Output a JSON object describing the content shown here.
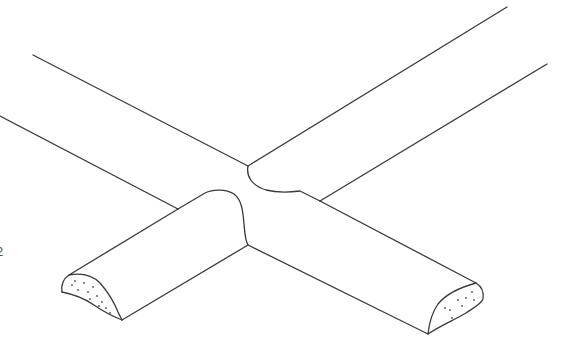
{
  "figure": {
    "line_color": "#3a3a3a",
    "background": "#ffffff",
    "reference_numeral": "2",
    "parts": [
      {
        "name": "rear-bar",
        "label": "Rear bar extending upper-left"
      },
      {
        "name": "right-bar",
        "label": "Bar extending upper-right"
      },
      {
        "name": "front-left-bar",
        "label": "Half-round bar, front-left, with cut end"
      },
      {
        "name": "front-right-bar",
        "label": "Half-round bar, front-right, with cut end"
      }
    ]
  }
}
